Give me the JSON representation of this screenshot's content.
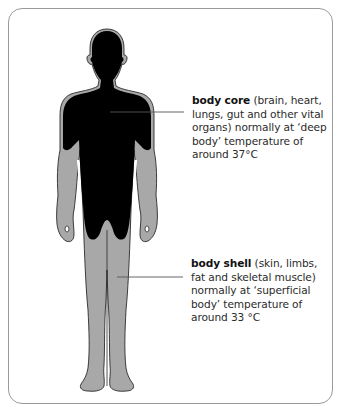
{
  "diagram": {
    "type": "labelled-illustration",
    "colors": {
      "core_fill": "#000000",
      "shell_fill": "#a8a8a8",
      "outline": "#2a2a2a",
      "frame_border": "#9a9a9a",
      "leader_line": "#555555",
      "text": "#2b2b2b"
    },
    "labels": {
      "core": {
        "term": "body core",
        "description": " (brain, heart, lungs, gut and other vital organs) normally at ‘deep body’ temperature of around 37°C"
      },
      "shell": {
        "term": "body shell",
        "description": " (skin, limbs, fat and skeletal muscle) normally at ‘superficial body’ temperature of around 33 °C"
      }
    },
    "temperatures": {
      "core_celsius": 37,
      "shell_celsius": 33
    }
  }
}
